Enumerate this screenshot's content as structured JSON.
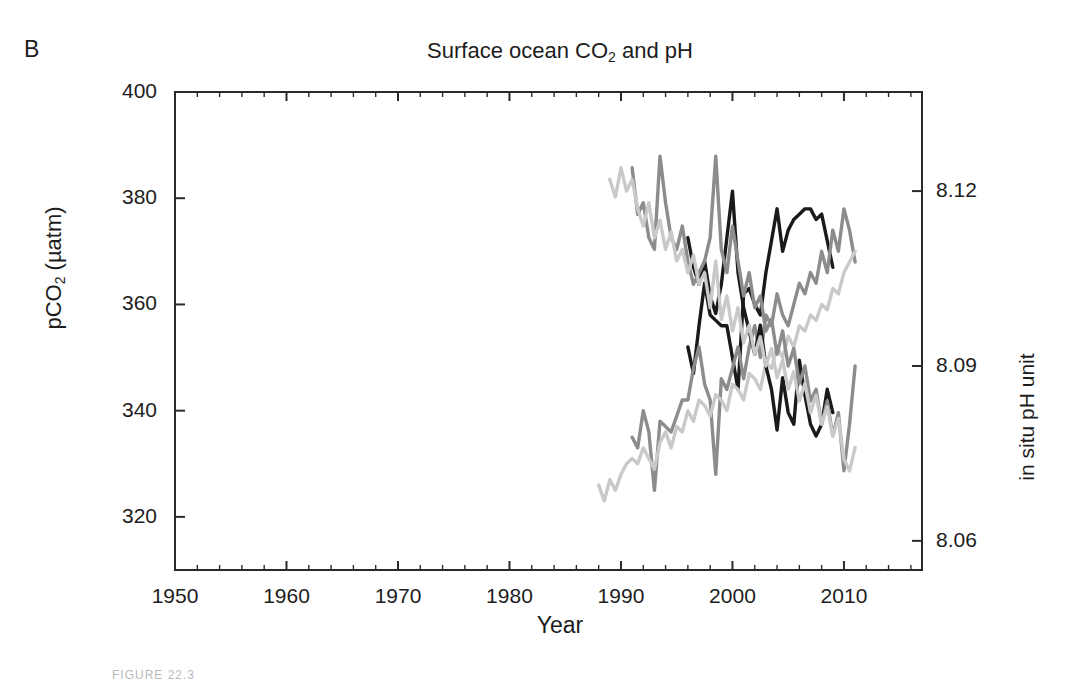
{
  "figure": {
    "panel_label": "B",
    "caption": "FIGURE 22.3"
  },
  "chart_data": {
    "type": "line",
    "title": "Surface ocean CO2 and pH",
    "title_html": "Surface ocean CO<sub>2</sub> and pH",
    "xlabel": "Year",
    "ylabel": "pCO2 (µatm)",
    "ylabel_html": "pCO<sub>2</sub> (µatm)",
    "ylabel_right": "in situ pH unit",
    "xlim": [
      1950,
      2017
    ],
    "ylim": [
      310,
      400
    ],
    "ylim_right": [
      8.055,
      8.137
    ],
    "grid": false,
    "legend": "none",
    "xticks": [
      1950,
      1960,
      1970,
      1980,
      1990,
      2000,
      2010
    ],
    "xtick_labels": [
      "1950",
      "1960",
      "1970",
      "1980",
      "1990",
      "2000",
      "2010"
    ],
    "xtick_minor_step": 2,
    "yticks": [
      320,
      340,
      360,
      380,
      400
    ],
    "ytick_labels": [
      "320",
      "340",
      "360",
      "380",
      "400"
    ],
    "yticks_right": [
      8.06,
      8.09,
      8.12
    ],
    "ytick_labels_right": [
      "8.06",
      "8.09",
      "8.12"
    ],
    "colors": {
      "series_dark": "#1a1a1a",
      "series_mid": "#8c8c8c",
      "series_light": "#c9c9c9",
      "axis": "#2a2a2a"
    },
    "series": [
      {
        "name": "pCO2 station dark",
        "panel": "pco2",
        "color": "#1a1a1a",
        "width": 3.4,
        "x": [
          1996.0,
          1996.5,
          1997.0,
          1997.5,
          1998.0,
          1998.5,
          1999.0,
          1999.5,
          2000.0,
          2000.5,
          2001.0,
          2001.5,
          2002.0,
          2002.5,
          2003.0,
          2003.5,
          2004.0,
          2004.5,
          2005.0,
          2005.5,
          2006.0,
          2006.5,
          2007.0,
          2007.5,
          2008.0,
          2008.5,
          2009.0
        ],
        "y": [
          352,
          347,
          356,
          364,
          358,
          357,
          356,
          356,
          350,
          344,
          362,
          363,
          360,
          358,
          366,
          372,
          378,
          370,
          374,
          376,
          377,
          378,
          378,
          376,
          377,
          372,
          367
        ]
      },
      {
        "name": "pCO2 station mid",
        "panel": "pco2",
        "color": "#8c8c8c",
        "width": 3.4,
        "x": [
          1991.0,
          1991.5,
          1992.0,
          1992.5,
          1993.0,
          1993.5,
          1994.0,
          1994.5,
          1995.0,
          1995.5,
          1996.0,
          1996.5,
          1997.0,
          1997.5,
          1998.0,
          1998.5,
          1999.0,
          1999.5,
          2000.0,
          2000.5,
          2001.0,
          2001.5,
          2002.0,
          2002.5,
          2003.0,
          2003.5,
          2004.0,
          2004.5,
          2005.0,
          2005.5,
          2006.0,
          2006.5,
          2007.0,
          2007.5,
          2008.0,
          2008.5,
          2009.0,
          2009.5,
          2010.0,
          2010.5,
          2011.0
        ],
        "y": [
          335,
          333,
          340,
          336,
          325,
          338,
          337,
          336,
          339,
          342,
          342,
          348,
          352,
          345,
          342,
          328,
          346,
          344,
          348,
          352,
          346,
          352,
          356,
          350,
          358,
          356,
          362,
          358,
          356,
          360,
          364,
          362,
          366,
          364,
          370,
          366,
          374,
          370,
          378,
          374,
          368
        ]
      },
      {
        "name": "pCO2 station light",
        "panel": "pco2",
        "color": "#c9c9c9",
        "width": 3.4,
        "x": [
          1988.0,
          1988.5,
          1989.0,
          1989.5,
          1990.0,
          1990.5,
          1991.0,
          1991.5,
          1992.0,
          1992.5,
          1993.0,
          1993.5,
          1994.0,
          1994.5,
          1995.0,
          1995.5,
          1996.0,
          1996.5,
          1997.0,
          1997.5,
          1998.0,
          1998.5,
          1999.0,
          1999.5,
          2000.0,
          2000.5,
          2001.0,
          2001.5,
          2002.0,
          2002.5,
          2003.0,
          2003.5,
          2004.0,
          2004.5,
          2005.0,
          2005.5,
          2006.0,
          2006.5,
          2007.0,
          2007.5,
          2008.0,
          2008.5,
          2009.0,
          2009.5,
          2010.0,
          2010.5,
          2011.0
        ],
        "y": [
          326,
          323,
          327,
          325,
          328,
          330,
          331,
          330,
          333,
          331,
          329,
          334,
          336,
          333,
          337,
          336,
          340,
          338,
          342,
          341,
          339,
          343,
          342,
          340,
          345,
          344,
          342,
          347,
          346,
          344,
          349,
          348,
          352,
          350,
          354,
          352,
          356,
          355,
          358,
          357,
          360,
          359,
          363,
          362,
          366,
          368,
          370
        ]
      },
      {
        "name": "pH station dark",
        "panel": "ph",
        "color": "#1a1a1a",
        "width": 3.4,
        "x": [
          1996.0,
          1996.5,
          1997.0,
          1997.5,
          1998.0,
          1998.5,
          1999.0,
          1999.5,
          2000.0,
          2000.5,
          2001.0,
          2001.5,
          2002.0,
          2002.5,
          2003.0,
          2003.5,
          2004.0,
          2004.5,
          2005.0,
          2005.5,
          2006.0,
          2006.5,
          2007.0,
          2007.5,
          2008.0,
          2008.5,
          2009.0
        ],
        "y": [
          8.112,
          8.107,
          8.104,
          8.108,
          8.102,
          8.099,
          8.104,
          8.112,
          8.12,
          8.106,
          8.1,
          8.096,
          8.092,
          8.097,
          8.09,
          8.086,
          8.079,
          8.088,
          8.082,
          8.08,
          8.091,
          8.085,
          8.08,
          8.078,
          8.08,
          8.086,
          8.082
        ]
      },
      {
        "name": "pH station mid",
        "panel": "ph",
        "color": "#8c8c8c",
        "width": 3.4,
        "x": [
          1991.0,
          1991.5,
          1992.0,
          1992.5,
          1993.0,
          1993.5,
          1994.0,
          1994.5,
          1995.0,
          1995.5,
          1996.0,
          1996.5,
          1997.0,
          1997.5,
          1998.0,
          1998.5,
          1999.0,
          1999.5,
          2000.0,
          2000.5,
          2001.0,
          2001.5,
          2002.0,
          2002.5,
          2003.0,
          2003.5,
          2004.0,
          2004.5,
          2005.0,
          2005.5,
          2006.0,
          2006.5,
          2007.0,
          2007.5,
          2008.0,
          2008.5,
          2009.0,
          2009.5,
          2010.0,
          2010.5,
          2011.0
        ],
        "y": [
          8.124,
          8.116,
          8.118,
          8.112,
          8.11,
          8.126,
          8.118,
          8.112,
          8.11,
          8.114,
          8.108,
          8.104,
          8.106,
          8.108,
          8.112,
          8.126,
          8.11,
          8.106,
          8.114,
          8.108,
          8.102,
          8.106,
          8.1,
          8.102,
          8.096,
          8.098,
          8.092,
          8.096,
          8.09,
          8.093,
          8.087,
          8.09,
          8.084,
          8.086,
          8.08,
          8.084,
          8.078,
          8.082,
          8.072,
          8.08,
          8.09
        ]
      },
      {
        "name": "pH station light",
        "panel": "ph",
        "color": "#c9c9c9",
        "width": 3.4,
        "x": [
          1989.0,
          1989.5,
          1990.0,
          1990.5,
          1991.0,
          1991.5,
          1992.0,
          1992.5,
          1993.0,
          1993.5,
          1994.0,
          1994.5,
          1995.0,
          1995.5,
          1996.0,
          1996.5,
          1997.0,
          1997.5,
          1998.0,
          1998.5,
          1999.0,
          1999.5,
          2000.0,
          2000.5,
          2001.0,
          2001.5,
          2002.0,
          2002.5,
          2003.0,
          2003.5,
          2004.0,
          2004.5,
          2005.0,
          2005.5,
          2006.0,
          2006.5,
          2007.0,
          2007.5,
          2008.0,
          2008.5,
          2009.0,
          2009.5,
          2010.0,
          2010.5,
          2011.0
        ],
        "y": [
          8.122,
          8.119,
          8.124,
          8.12,
          8.122,
          8.117,
          8.114,
          8.118,
          8.112,
          8.115,
          8.11,
          8.113,
          8.108,
          8.11,
          8.106,
          8.109,
          8.104,
          8.106,
          8.1,
          8.108,
          8.098,
          8.102,
          8.096,
          8.1,
          8.094,
          8.097,
          8.092,
          8.095,
          8.09,
          8.093,
          8.088,
          8.091,
          8.086,
          8.089,
          8.084,
          8.087,
          8.082,
          8.085,
          8.08,
          8.083,
          8.078,
          8.081,
          8.074,
          8.072,
          8.076
        ]
      }
    ]
  }
}
